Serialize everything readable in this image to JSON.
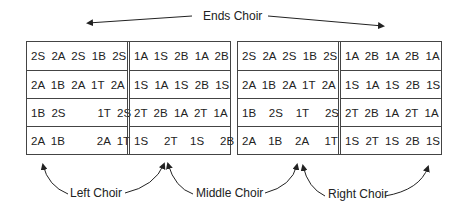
{
  "labels": {
    "top": "Ends Choir",
    "left": "Left Choir",
    "middle": "Middle Choir",
    "right": "Right Choir"
  },
  "left_block": {
    "col1": [
      "2S  2A  2S  1B  2S",
      "2A  1B  2A  1T  2A",
      "1B  2S          1T  2S",
      "2A  1B          2A  1T"
    ],
    "col2": [
      "1A  1S  2B  1A  2B",
      "1S  1A  1S  2B  1S",
      "2T  2B  1A  2T  1A",
      "1S     2T    1S     2B"
    ]
  },
  "right_block": {
    "col1": [
      "2S  2A  2S  1B  2S",
      "2A  1B  2A  1T  2A",
      "1B    2S    1T     2S",
      "2A    1B    2A     1T"
    ],
    "col2": [
      "1A  2B  1A  2B  1A",
      "1S  1A  1S  2B  1S",
      "2T  2B  1A  2T  1A",
      "1S  2T  1S  2B  1S"
    ]
  }
}
